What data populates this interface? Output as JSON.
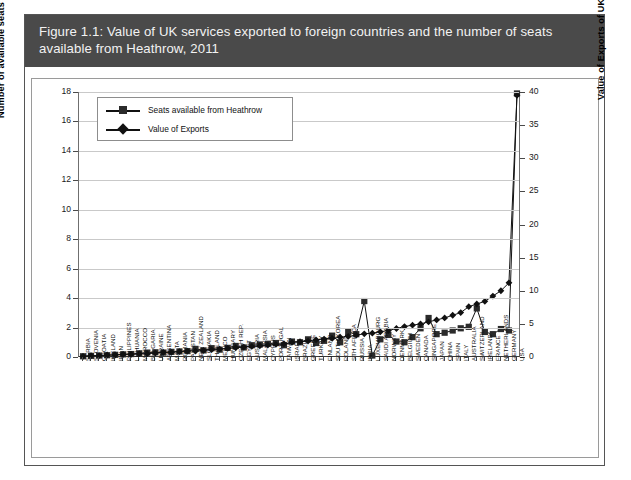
{
  "figure": {
    "title": "Figure 1.1: Value of UK services exported to foreign countries and the number of seats available from Heathrow, 2011",
    "banner_color": "#4a4a4a",
    "banner_text_color": "#ffffff"
  },
  "legend": {
    "position": "top-left-inside",
    "items": [
      {
        "label": "Seats available from Heathrow",
        "marker": "square",
        "color": "#2b2b2b"
      },
      {
        "label": "Value of Exports",
        "marker": "diamond",
        "color": "#111111"
      }
    ]
  },
  "chart_data": {
    "type": "line",
    "title": "Figure 1.1: Value of UK services exported to foreign countries and the number of seats available from Heathrow, 2011",
    "xlabel": "",
    "ylabel": "Number of available seats offered from Heathrow, million",
    "y2label": "Value of Exports of UK services £ billion",
    "ylim": [
      0,
      18
    ],
    "yticks": [
      0,
      2,
      4,
      6,
      8,
      10,
      12,
      14,
      16,
      18
    ],
    "y2lim": [
      0,
      40
    ],
    "y2ticks": [
      0,
      5,
      10,
      15,
      20,
      25,
      30,
      35,
      40
    ],
    "grid": true,
    "legend_position": "upper left",
    "categories": [
      "SERBIA",
      "SLOVENIA",
      "CROATIA",
      "ICELAND",
      "IRAN",
      "PHILIPPINES",
      "LITHUANIA",
      "MOROCCO",
      "BULGARIA",
      "UKRAINE",
      "ARGENTINA",
      "MALTA",
      "ROMANIA",
      "PAKISTAN",
      "NEW ZEALAND",
      "SLOVAKIA",
      "THAILAND",
      "MEXICO",
      "HUNGARY",
      "CZECH REP.",
      "EGYPT",
      "AUSTRIA",
      "MALAYSIA",
      "CYPRUS",
      "PORTUGAL",
      "TAIWAN",
      "ISRAEL",
      "BRAZIL",
      "GREECE",
      "TURKEY",
      "FINLAND",
      "SOUTH KOREA",
      "POLAND",
      "STH AFRICA",
      "RUSSIA",
      "INDIA",
      "LUXEMBOURG",
      "SAUDI ARABIA",
      "NORWAY",
      "DENMARK",
      "BELGIUM",
      "SWEDEN",
      "CANADA",
      "SINGAPORE",
      "JAPAN",
      "CHINA",
      "SPAIN",
      "ITALY",
      "AUSTRALIA",
      "SWITZERLAND",
      "IRELAND",
      "FRANCE",
      "NETHERLANDS",
      "GERMANY",
      "USA"
    ],
    "series": [
      {
        "name": "Seats available from Heathrow",
        "axis": "left",
        "unit": "million",
        "marker": "square",
        "values": [
          0.05,
          0.08,
          0.1,
          0.12,
          0.15,
          0.18,
          0.2,
          0.25,
          0.3,
          0.32,
          0.3,
          0.35,
          0.38,
          0.4,
          0.55,
          0.45,
          0.6,
          0.5,
          0.62,
          0.75,
          0.65,
          0.8,
          0.85,
          0.9,
          0.95,
          0.8,
          1.05,
          1.0,
          1.2,
          0.95,
          1.1,
          1.45,
          1.0,
          1.7,
          1.55,
          3.8,
          0.1,
          1.2,
          1.5,
          1.05,
          1.0,
          1.35,
          1.95,
          2.65,
          1.55,
          1.65,
          1.8,
          1.95,
          2.05,
          3.3,
          1.7,
          1.55,
          1.9,
          1.8,
          17.9
        ]
      },
      {
        "name": "Value of Exports",
        "axis": "right",
        "unit": "£ billion",
        "marker": "diamond",
        "values": [
          0.1,
          0.2,
          0.2,
          0.3,
          0.3,
          0.4,
          0.4,
          0.5,
          0.5,
          0.6,
          0.7,
          0.7,
          0.8,
          0.9,
          0.9,
          1.0,
          1.1,
          1.2,
          1.3,
          1.4,
          1.5,
          1.6,
          1.7,
          1.8,
          1.9,
          2.0,
          2.2,
          2.3,
          2.4,
          2.6,
          2.7,
          2.8,
          3.0,
          3.1,
          3.3,
          3.5,
          3.6,
          3.8,
          4.0,
          4.3,
          4.6,
          4.8,
          5.0,
          5.3,
          5.6,
          5.9,
          6.3,
          6.7,
          7.6,
          8.0,
          8.4,
          9.2,
          10.0,
          11.2,
          39.5
        ]
      }
    ]
  }
}
